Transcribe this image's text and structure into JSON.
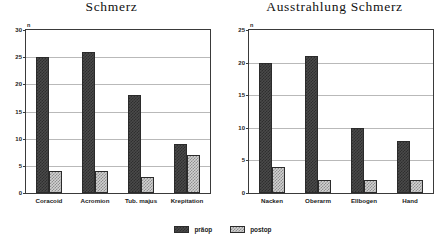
{
  "legend": {
    "position": "bottom-center",
    "items": [
      {
        "label": "präop",
        "series": "preop",
        "color": "#3a3a3a"
      },
      {
        "label": "postop",
        "series": "postop",
        "color": "#d2d2d2"
      }
    ]
  },
  "axis_unit_label": "n",
  "chart_data": [
    {
      "type": "bar",
      "title": "Schmerz",
      "xlabel": "",
      "ylabel": "n",
      "ylim": [
        0,
        30
      ],
      "yticks": [
        0,
        5,
        10,
        15,
        20,
        25,
        30
      ],
      "grid": true,
      "legend_position": "bottom-center",
      "categories": [
        "Coracoid",
        "Acromion",
        "Tub. majus",
        "Krepitation"
      ],
      "series": [
        {
          "name": "präop",
          "values": [
            25,
            26,
            18,
            9
          ]
        },
        {
          "name": "postop",
          "values": [
            4,
            4,
            3,
            7
          ]
        }
      ]
    },
    {
      "type": "bar",
      "title": "Ausstrahlung Schmerz",
      "xlabel": "",
      "ylabel": "n",
      "ylim": [
        0,
        25
      ],
      "yticks": [
        0,
        5,
        10,
        15,
        20,
        25
      ],
      "grid": true,
      "legend_position": "bottom-center",
      "categories": [
        "Nacken",
        "Oberarm",
        "Ellbogen",
        "Hand"
      ],
      "series": [
        {
          "name": "präop",
          "values": [
            20,
            21,
            10,
            8
          ]
        },
        {
          "name": "postop",
          "values": [
            4,
            2,
            2,
            2
          ]
        }
      ]
    }
  ]
}
